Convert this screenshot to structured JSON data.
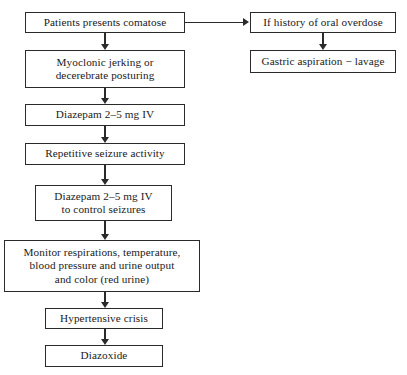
{
  "diagram": {
    "type": "flowchart",
    "title": "",
    "orientation": "top-down with right branch",
    "nodes": [
      {
        "id": "comatose",
        "label": "Patients presents comatose",
        "shape": "rectangle",
        "column": "left",
        "x": 25,
        "y": 12,
        "w": 160,
        "h": 21
      },
      {
        "id": "oral-overdose",
        "label": "If history of oral overdose",
        "shape": "rectangle",
        "column": "right",
        "x": 250,
        "y": 12,
        "w": 146,
        "h": 21
      },
      {
        "id": "gastric-lavage",
        "label": "Gastric aspiration − lavage",
        "shape": "rectangle",
        "column": "right",
        "x": 250,
        "y": 50,
        "w": 146,
        "h": 23
      },
      {
        "id": "myoclonic",
        "label": "Myoclonic jerking or\ndecerebrate posturing",
        "shape": "rectangle",
        "column": "left",
        "x": 25,
        "y": 50,
        "w": 160,
        "h": 38
      },
      {
        "id": "diazepam-1",
        "label": "Diazepam 2–5 mg IV",
        "shape": "rectangle",
        "column": "left",
        "x": 25,
        "y": 104,
        "w": 160,
        "h": 22
      },
      {
        "id": "repetitive-seizure",
        "label": "Repetitive seizure activity",
        "shape": "rectangle",
        "column": "left",
        "x": 25,
        "y": 143,
        "w": 160,
        "h": 22
      },
      {
        "id": "diazepam-2",
        "label": "Diazepam 2–5 mg IV\nto control seizures",
        "shape": "rectangle",
        "column": "left",
        "x": 35,
        "y": 185,
        "w": 137,
        "h": 36
      },
      {
        "id": "monitor",
        "label": "Monitor respirations, temperature,\nblood pressure and urine output\nand color (red urine)",
        "shape": "rectangle",
        "column": "left",
        "x": 4,
        "y": 240,
        "w": 196,
        "h": 52
      },
      {
        "id": "hypertensive-crisis",
        "label": "Hypertensive crisis",
        "shape": "rectangle",
        "column": "left",
        "x": 45,
        "y": 308,
        "w": 118,
        "h": 21
      },
      {
        "id": "diazoxide",
        "label": "Diazoxide",
        "shape": "rectangle",
        "column": "left",
        "x": 45,
        "y": 345,
        "w": 118,
        "h": 22
      }
    ],
    "edges": [
      {
        "id": "e1",
        "from": "comatose",
        "to": "oral-overdose",
        "direction": "right",
        "arrowhead": true
      },
      {
        "id": "e2",
        "from": "comatose",
        "to": "myoclonic",
        "direction": "down",
        "arrowhead": true
      },
      {
        "id": "e3",
        "from": "oral-overdose",
        "to": "gastric-lavage",
        "direction": "down",
        "arrowhead": true
      },
      {
        "id": "e4",
        "from": "myoclonic",
        "to": "diazepam-1",
        "direction": "down",
        "arrowhead": true
      },
      {
        "id": "e5",
        "from": "diazepam-1",
        "to": "repetitive-seizure",
        "direction": "down",
        "arrowhead": true
      },
      {
        "id": "e6",
        "from": "repetitive-seizure",
        "to": "diazepam-2",
        "direction": "down",
        "arrowhead": true
      },
      {
        "id": "e7",
        "from": "diazepam-2",
        "to": "monitor",
        "direction": "down",
        "arrowhead": true
      },
      {
        "id": "e8",
        "from": "monitor",
        "to": "hypertensive-crisis",
        "direction": "down",
        "arrowhead": true
      },
      {
        "id": "e9",
        "from": "hypertensive-crisis",
        "to": "diazoxide",
        "direction": "down",
        "arrowhead": true
      }
    ],
    "colors": {
      "background": "#ffffff",
      "border": "#2a2a2a",
      "text": "#1a1a1a",
      "connector": "#2a2a2a"
    }
  }
}
